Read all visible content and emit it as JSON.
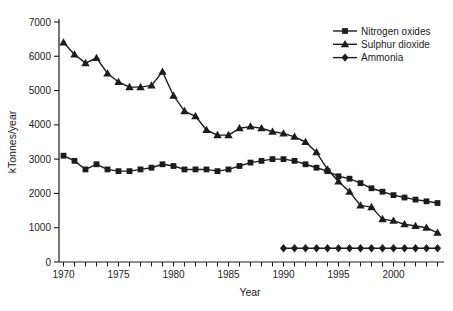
{
  "chart_data": {
    "type": "line",
    "title": "",
    "xlabel": "Year",
    "ylabel": "kTonnes/year",
    "xlim": [
      1970,
      2004
    ],
    "ylim": [
      0,
      7000
    ],
    "y_tick_step": 1000,
    "y_tick_labels": [
      "0",
      "1000",
      "2000",
      "3000",
      "4000",
      "5000",
      "6000",
      "7000"
    ],
    "x_major_ticks": [
      1970,
      1975,
      1980,
      1985,
      1990,
      1995,
      2000
    ],
    "x_minor_tick_every": 1,
    "grid": false,
    "legend_position": "top-right",
    "line_color": "#1c1c1c",
    "background": "#ffffff",
    "series": [
      {
        "name": "Nitrogen oxides",
        "marker": "square-marker-icon",
        "x": [
          1970,
          1971,
          1972,
          1973,
          1974,
          1975,
          1976,
          1977,
          1978,
          1979,
          1980,
          1981,
          1982,
          1983,
          1984,
          1985,
          1986,
          1987,
          1988,
          1989,
          1990,
          1991,
          1992,
          1993,
          1994,
          1995,
          1996,
          1997,
          1998,
          1999,
          2000,
          2001,
          2002,
          2003,
          2004
        ],
        "values": [
          3100,
          2950,
          2700,
          2850,
          2700,
          2650,
          2650,
          2700,
          2750,
          2850,
          2800,
          2700,
          2700,
          2700,
          2650,
          2700,
          2800,
          2900,
          2950,
          3000,
          3000,
          2950,
          2850,
          2750,
          2650,
          2500,
          2430,
          2300,
          2150,
          2050,
          1950,
          1880,
          1820,
          1770,
          1720
        ]
      },
      {
        "name": "Sulphur dioxide",
        "marker": "triangle-marker-icon",
        "x": [
          1970,
          1971,
          1972,
          1973,
          1974,
          1975,
          1976,
          1977,
          1978,
          1979,
          1980,
          1981,
          1982,
          1983,
          1984,
          1985,
          1986,
          1987,
          1988,
          1989,
          1990,
          1991,
          1992,
          1993,
          1994,
          1995,
          1996,
          1997,
          1998,
          1999,
          2000,
          2001,
          2002,
          2003,
          2004
        ],
        "values": [
          6400,
          6050,
          5800,
          5950,
          5500,
          5250,
          5100,
          5100,
          5150,
          5550,
          4850,
          4400,
          4250,
          3850,
          3700,
          3700,
          3900,
          3950,
          3900,
          3800,
          3750,
          3650,
          3500,
          3200,
          2700,
          2350,
          2050,
          1650,
          1600,
          1250,
          1200,
          1100,
          1050,
          1000,
          850
        ]
      },
      {
        "name": "Ammonia",
        "marker": "diamond-marker-icon",
        "x": [
          1990,
          1991,
          1992,
          1993,
          1994,
          1995,
          1996,
          1997,
          1998,
          1999,
          2000,
          2001,
          2002,
          2003,
          2004
        ],
        "values": [
          400,
          400,
          400,
          400,
          400,
          400,
          400,
          400,
          400,
          400,
          400,
          400,
          400,
          400,
          400
        ]
      }
    ]
  }
}
